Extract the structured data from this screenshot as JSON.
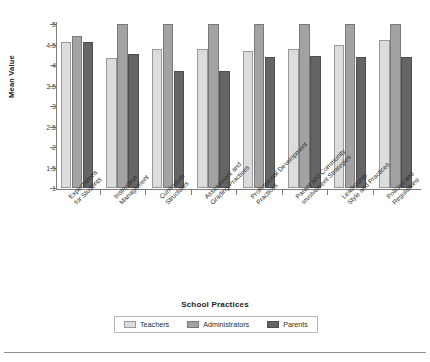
{
  "chart_data": {
    "type": "bar",
    "title": "",
    "xlabel": "School Practices",
    "ylabel": "Mean Value",
    "ylim": [
      1,
      5
    ],
    "yticks": [
      1,
      1.5,
      2,
      2.5,
      3,
      3.5,
      4,
      4.5,
      5
    ],
    "ytick_labels": [
      "1",
      "1.5",
      "2",
      "2.5",
      "3",
      "3.5",
      "4",
      "4.5",
      "5"
    ],
    "grid": false,
    "legend_position": "bottom",
    "categories": [
      "Expectations\nfor Students",
      "Instruction\nManagement",
      "Curriculum\nStructures",
      "Assessment and\nGrading Practices",
      "Professional Development\nPractices",
      "Parent and Community\nInvolvement Strategies",
      "Leadership\nStyle and Practices",
      "Policies and\nRegulations"
    ],
    "series": [
      {
        "name": "Teachers",
        "color": "#dcdcdc",
        "values": [
          4.55,
          4.18,
          4.38,
          4.38,
          4.35,
          4.4,
          4.48,
          4.6
        ]
      },
      {
        "name": "Administrators",
        "color": "#a3a3a3",
        "values": [
          4.7,
          5.0,
          5.0,
          5.0,
          5.0,
          5.0,
          5.0,
          5.0
        ]
      },
      {
        "name": "Parents",
        "color": "#656565",
        "values": [
          4.57,
          4.28,
          3.85,
          3.85,
          4.2,
          4.22,
          4.2,
          4.2
        ]
      }
    ]
  },
  "legend": {
    "items": [
      {
        "label": "Teachers",
        "swatch": "light-gray-swatch"
      },
      {
        "label": "Administrators",
        "swatch": "medium-gray-swatch"
      },
      {
        "label": "Parents",
        "swatch": "dark-gray-swatch"
      }
    ]
  }
}
